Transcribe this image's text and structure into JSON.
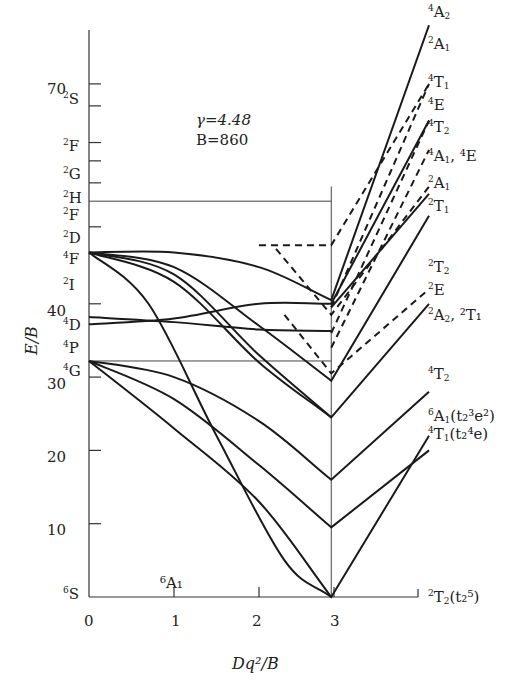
{
  "chart_data": {
    "type": "line",
    "parameters": {
      "gamma": "γ=4.48",
      "B": "B=860"
    },
    "xlabel": "Dq²/B",
    "ylabel": "E/B",
    "xlim": [
      0,
      4.0
    ],
    "ylim": [
      0,
      78
    ],
    "x_ticks": [
      "0",
      "1",
      "2",
      "3"
    ],
    "y_ticks": [
      "10",
      "20",
      "30",
      "40",
      "70"
    ],
    "critical_x": 2.85,
    "free_ion_terms_left": [
      {
        "term": "6S",
        "sup": "6",
        "base": "S",
        "energy": 0
      },
      {
        "term": "4G",
        "sup": "4",
        "base": "G",
        "energy": 32.2
      },
      {
        "term": "4P",
        "sup": "4",
        "base": "P",
        "energy": 35.2
      },
      {
        "term": "4D",
        "sup": "4",
        "base": "D",
        "energy": 37.7
      },
      {
        "term": "2I",
        "sup": "2",
        "base": "I",
        "energy": 44.5
      },
      {
        "term": "4F",
        "sup": "4",
        "base": "F",
        "energy": 47.0
      },
      {
        "term": "2D",
        "sup": "2",
        "base": "D",
        "energy": 50.5
      },
      {
        "term": "2F",
        "sup": "2",
        "base": "F",
        "energy": 54.0
      },
      {
        "term": "2H",
        "sup": "2",
        "base": "H",
        "energy": 56.5
      },
      {
        "term": "2G",
        "sup": "2",
        "base": "G",
        "energy": 59.5
      },
      {
        "term": "2F",
        "sup": "2",
        "base": "F",
        "energy": 62.0
      },
      {
        "term": "2S",
        "sup": "2",
        "base": "S",
        "energy": 67.0
      }
    ],
    "right_labels": [
      {
        "text": "4A2",
        "sup": "4",
        "base": "A",
        "sub": "2",
        "extra": ""
      },
      {
        "text": "2A1",
        "sup": "2",
        "base": "A",
        "sub": "1",
        "extra": ""
      },
      {
        "text": "4T1",
        "sup": "4",
        "base": "T",
        "sub": "1",
        "extra": ""
      },
      {
        "text": "4E",
        "sup": "4",
        "base": "E",
        "sub": "",
        "extra": ""
      },
      {
        "text": "4T2",
        "sup": "4",
        "base": "T",
        "sub": "2",
        "extra": ""
      },
      {
        "text": "4A1, 4E",
        "sup": "4",
        "base": "A",
        "sub": "1",
        "extra": ", ⁴E"
      },
      {
        "text": "2A1",
        "sup": "2",
        "base": "A",
        "sub": "1",
        "extra": ""
      },
      {
        "text": "2T1",
        "sup": "2",
        "base": "T",
        "sub": "1",
        "extra": ""
      },
      {
        "text": "2T2",
        "sup": "2",
        "base": "T",
        "sub": "2",
        "extra": ""
      },
      {
        "text": "2E",
        "sup": "2",
        "base": "E",
        "sub": "",
        "extra": ""
      },
      {
        "text": "2A2, 2T1",
        "sup": "2",
        "base": "A",
        "sub": "2",
        "extra": ", ²T₁"
      },
      {
        "text": "4T2",
        "sup": "4",
        "base": "T",
        "sub": "2",
        "extra": ""
      },
      {
        "text": "6A1(t2^3 e^2)",
        "sup": "6",
        "base": "A",
        "sub": "1",
        "extra": "(t₂³e²)"
      },
      {
        "text": "4T1(t2^4 e)",
        "sup": "4",
        "base": "T",
        "sub": "1",
        "extra": "(t₂⁴e)"
      },
      {
        "text": "2T2(t2^5)",
        "sup": "2",
        "base": "T",
        "sub": "2",
        "extra": "(t₂⁵)"
      }
    ],
    "ground_state_label": "6A1",
    "series": [
      {
        "name": "4T1 (t2^4 e)",
        "style": "solid",
        "points": [
          [
            0,
            32.2
          ],
          [
            1,
            23
          ],
          [
            2,
            13
          ],
          [
            2.85,
            0
          ],
          [
            4.0,
            22
          ]
        ]
      },
      {
        "name": "4T2",
        "style": "solid",
        "points": [
          [
            0,
            32.2
          ],
          [
            1,
            27
          ],
          [
            2,
            18
          ],
          [
            2.85,
            9.5
          ],
          [
            4.0,
            20
          ]
        ]
      },
      {
        "name": "4A1,4E / 4G branch",
        "style": "solid",
        "points": [
          [
            0,
            32.2
          ],
          [
            1,
            30
          ],
          [
            2,
            24
          ],
          [
            2.85,
            16
          ],
          [
            4.0,
            28
          ]
        ]
      },
      {
        "name": "4T1 (from 4P)",
        "style": "solid",
        "points": [
          [
            0,
            47
          ],
          [
            0.7,
            40
          ],
          [
            1.5,
            22
          ],
          [
            2.3,
            5
          ],
          [
            2.85,
            0
          ]
        ]
      },
      {
        "name": "2T2 (t2^5)",
        "style": "solid",
        "points": [
          [
            0,
            47
          ],
          [
            1,
            44
          ],
          [
            2,
            33
          ],
          [
            2.85,
            24.5
          ],
          [
            4.0,
            40
          ]
        ]
      },
      {
        "name": "4T2 (upper)",
        "style": "solid",
        "points": [
          [
            0,
            47
          ],
          [
            1,
            43
          ],
          [
            2,
            32
          ],
          [
            2.85,
            24.5
          ]
        ]
      },
      {
        "name": "4E/4D",
        "style": "solid",
        "points": [
          [
            0,
            38.2
          ],
          [
            1,
            37.5
          ],
          [
            2,
            36.5
          ],
          [
            2.85,
            36.3
          ]
        ]
      },
      {
        "name": "2A2,2T1",
        "style": "solid",
        "points": [
          [
            0,
            47
          ],
          [
            1,
            45
          ],
          [
            2,
            37
          ],
          [
            2.85,
            29.5
          ],
          [
            4.0,
            52
          ]
        ]
      },
      {
        "name": "4A2",
        "style": "solid",
        "points": [
          [
            0,
            47
          ],
          [
            1,
            47
          ],
          [
            2,
            45
          ],
          [
            2.85,
            40.5
          ],
          [
            4.0,
            78
          ]
        ]
      },
      {
        "name": "4E (mid)",
        "style": "solid",
        "points": [
          [
            0,
            37.2
          ],
          [
            1,
            38
          ],
          [
            2,
            40
          ],
          [
            2.85,
            40
          ],
          [
            4.0,
            65
          ]
        ]
      },
      {
        "name": "2A1 (right)",
        "style": "solid",
        "points": [
          [
            2.85,
            39.5
          ],
          [
            4.0,
            55
          ]
        ]
      },
      {
        "name": "2A1 dashed",
        "style": "dashed",
        "points": [
          [
            2.85,
            39.5
          ],
          [
            4.0,
            70
          ]
        ]
      },
      {
        "name": "4T1 dashed",
        "style": "dashed",
        "points": [
          [
            2.85,
            36
          ],
          [
            4.0,
            65
          ]
        ]
      },
      {
        "name": "4T2 dashed",
        "style": "dashed",
        "points": [
          [
            2.85,
            34
          ],
          [
            4.0,
            61
          ]
        ]
      },
      {
        "name": "2T2 dashed",
        "style": "dashed",
        "points": [
          [
            2.2,
            47.5
          ],
          [
            2.85,
            38.5
          ],
          [
            4.0,
            56
          ]
        ]
      },
      {
        "name": "2E dashed",
        "style": "dashed",
        "points": [
          [
            2.3,
            38.5
          ],
          [
            2.85,
            30.5
          ],
          [
            4.0,
            42
          ]
        ]
      },
      {
        "name": "2T1 dashed",
        "style": "dashed",
        "points": [
          [
            2.0,
            48
          ],
          [
            2.85,
            48
          ],
          [
            4.0,
            70
          ]
        ]
      }
    ],
    "reference_lines": [
      {
        "orientation": "horizontal",
        "y": 54.0,
        "x_range": [
          0,
          2.85
        ],
        "label": "2F"
      },
      {
        "orientation": "horizontal",
        "y": 32.2,
        "x_range": [
          0,
          2.85
        ],
        "label": "4G"
      },
      {
        "orientation": "vertical",
        "x": 2.85,
        "y_range": [
          0,
          56
        ]
      }
    ],
    "grid": false,
    "legend": "none"
  },
  "labels": {
    "gamma": "γ=4.48",
    "B": "B=860",
    "xlabel": "Dq²/B",
    "ylabel": "E/B",
    "ground": "⁶A₁"
  }
}
